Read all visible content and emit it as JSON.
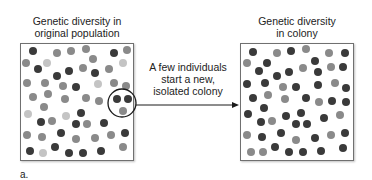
{
  "left_panel": {
    "title_line1": "Genetic diversity in",
    "title_line2": "original population"
  },
  "right_panel": {
    "title_line1": "Genetic diversity",
    "title_line2": "in colony"
  },
  "arrow_caption": {
    "line1": "A few individuals",
    "line2": "start a new,",
    "line3": "isolated colony"
  },
  "panel_label": "a.",
  "colors": {
    "dark": "#3a3a3a",
    "mid": "#8a8a8a",
    "light": "#c4c4c4",
    "border": "#707070"
  },
  "left_dots": [
    [
      33,
      51,
      "d"
    ],
    [
      57,
      53,
      "m"
    ],
    [
      71,
      51,
      "m"
    ],
    [
      86,
      49,
      "m"
    ],
    [
      114,
      53,
      "d"
    ],
    [
      127,
      50,
      "m"
    ],
    [
      26,
      63,
      "m"
    ],
    [
      47,
      63,
      "l"
    ],
    [
      93,
      59,
      "m"
    ],
    [
      123,
      63,
      "l"
    ],
    [
      38,
      69,
      "d"
    ],
    [
      69,
      71,
      "d"
    ],
    [
      83,
      68,
      "m"
    ],
    [
      95,
      73,
      "d"
    ],
    [
      109,
      69,
      "m"
    ],
    [
      57,
      76,
      "d"
    ],
    [
      27,
      83,
      "m"
    ],
    [
      45,
      83,
      "m"
    ],
    [
      63,
      86,
      "m"
    ],
    [
      76,
      87,
      "d"
    ],
    [
      98,
      84,
      "l"
    ],
    [
      114,
      83,
      "m"
    ],
    [
      126,
      86,
      "m"
    ],
    [
      33,
      97,
      "m"
    ],
    [
      48,
      94,
      "m"
    ],
    [
      65,
      99,
      "m"
    ],
    [
      86,
      98,
      "m"
    ],
    [
      99,
      101,
      "m"
    ],
    [
      117,
      99,
      "d"
    ],
    [
      128,
      99,
      "d"
    ],
    [
      44,
      107,
      "m"
    ],
    [
      28,
      114,
      "l"
    ],
    [
      81,
      113,
      "d"
    ],
    [
      123,
      111,
      "m"
    ],
    [
      41,
      122,
      "d"
    ],
    [
      52,
      121,
      "m"
    ],
    [
      66,
      116,
      "l"
    ],
    [
      76,
      124,
      "d"
    ],
    [
      87,
      124,
      "m"
    ],
    [
      104,
      123,
      "d"
    ],
    [
      61,
      133,
      "d"
    ],
    [
      27,
      135,
      "m"
    ],
    [
      42,
      137,
      "m"
    ],
    [
      76,
      139,
      "m"
    ],
    [
      95,
      138,
      "m"
    ],
    [
      111,
      135,
      "m"
    ],
    [
      125,
      133,
      "d"
    ],
    [
      55,
      147,
      "d"
    ],
    [
      30,
      151,
      "d"
    ],
    [
      43,
      153,
      "l"
    ],
    [
      69,
      153,
      "d"
    ],
    [
      83,
      153,
      "d"
    ],
    [
      101,
      151,
      "d"
    ],
    [
      123,
      147,
      "m"
    ]
  ],
  "right_dots": [
    [
      253,
      52,
      "d"
    ],
    [
      277,
      53,
      "m"
    ],
    [
      291,
      51,
      "d"
    ],
    [
      306,
      49,
      "m"
    ],
    [
      329,
      53,
      "m"
    ],
    [
      345,
      53,
      "d"
    ],
    [
      247,
      63,
      "m"
    ],
    [
      267,
      63,
      "d"
    ],
    [
      315,
      61,
      "d"
    ],
    [
      259,
      71,
      "d"
    ],
    [
      289,
      72,
      "d"
    ],
    [
      303,
      68,
      "m"
    ],
    [
      318,
      72,
      "d"
    ],
    [
      331,
      67,
      "m"
    ],
    [
      343,
      67,
      "d"
    ],
    [
      277,
      76,
      "d"
    ],
    [
      247,
      84,
      "d"
    ],
    [
      265,
      83,
      "d"
    ],
    [
      283,
      87,
      "m"
    ],
    [
      296,
      87,
      "d"
    ],
    [
      318,
      85,
      "d"
    ],
    [
      335,
      83,
      "m"
    ],
    [
      346,
      88,
      "d"
    ],
    [
      253,
      98,
      "d"
    ],
    [
      268,
      95,
      "m"
    ],
    [
      285,
      99,
      "m"
    ],
    [
      306,
      98,
      "d"
    ],
    [
      319,
      102,
      "m"
    ],
    [
      332,
      101,
      "d"
    ],
    [
      346,
      102,
      "d"
    ],
    [
      264,
      108,
      "d"
    ],
    [
      248,
      114,
      "d"
    ],
    [
      301,
      113,
      "d"
    ],
    [
      340,
      115,
      "m"
    ],
    [
      261,
      122,
      "d"
    ],
    [
      272,
      121,
      "m"
    ],
    [
      286,
      116,
      "d"
    ],
    [
      296,
      124,
      "d"
    ],
    [
      307,
      124,
      "d"
    ],
    [
      324,
      118,
      "d"
    ],
    [
      281,
      133,
      "d"
    ],
    [
      247,
      135,
      "m"
    ],
    [
      262,
      137,
      "d"
    ],
    [
      296,
      140,
      "m"
    ],
    [
      315,
      138,
      "d"
    ],
    [
      331,
      135,
      "m"
    ],
    [
      345,
      133,
      "d"
    ],
    [
      275,
      147,
      "d"
    ],
    [
      251,
      152,
      "m"
    ],
    [
      263,
      152,
      "m"
    ],
    [
      289,
      152,
      "d"
    ],
    [
      303,
      152,
      "d"
    ],
    [
      321,
      151,
      "d"
    ],
    [
      343,
      148,
      "d"
    ]
  ]
}
